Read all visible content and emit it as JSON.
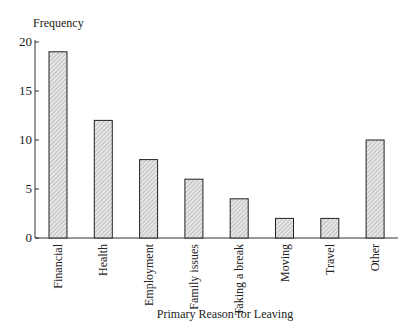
{
  "chart_data": {
    "type": "bar",
    "title": "",
    "xlabel": "Primary Reason for Leaving",
    "ylabel": "Frequency",
    "categories": [
      "Financial",
      "Health",
      "Employment",
      "Family issues",
      "Taking a break",
      "Moving",
      "Travel",
      "Other"
    ],
    "values": [
      19,
      12,
      8,
      6,
      4,
      2,
      2,
      10
    ],
    "ylim": [
      0,
      20
    ],
    "yticks": [
      0,
      5,
      10,
      15,
      20
    ],
    "grid": false,
    "legend": null,
    "bar_fill": "hatched light gray",
    "colors": {
      "bar_fill": "#d9d9d9",
      "bar_stroke": "#222222",
      "axis": "#333333"
    }
  }
}
